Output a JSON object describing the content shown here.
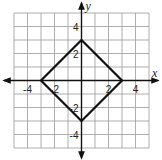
{
  "chart_data": {
    "type": "line",
    "title": "",
    "xlabel": "x",
    "ylabel": "y",
    "xlim": [
      -5,
      5
    ],
    "ylim": [
      -5,
      5
    ],
    "grid": true,
    "x_ticks": [
      {
        "value": -4,
        "label": "-4"
      },
      {
        "value": -2,
        "label": "-2"
      },
      {
        "value": 2,
        "label": "2"
      },
      {
        "value": 4,
        "label": "4"
      }
    ],
    "y_ticks": [
      {
        "value": 4,
        "label": "4"
      },
      {
        "value": 2,
        "label": "2"
      },
      {
        "value": -2,
        "label": "-2"
      },
      {
        "value": -4,
        "label": "-4"
      }
    ],
    "series": [
      {
        "name": "square",
        "closed": true,
        "points": [
          [
            0,
            3
          ],
          [
            3,
            0
          ],
          [
            0,
            -3
          ],
          [
            -3,
            0
          ]
        ]
      }
    ],
    "colors": {
      "grid": "#9a9a9a",
      "axis": "#111111",
      "shape": "#111111"
    }
  }
}
